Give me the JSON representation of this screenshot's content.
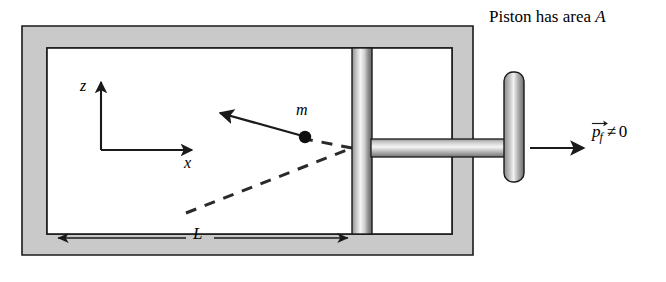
{
  "figure": {
    "title_caption": "Piston has area A",
    "caption_prefix": "Piston has area ",
    "caption_var": "A",
    "labels": {
      "axis_z": "z",
      "axis_x": "x",
      "mass": "m",
      "length": "L",
      "momentum_p": "p",
      "momentum_sub": "f",
      "momentum_rel": "≠",
      "momentum_value": "0"
    },
    "colors": {
      "wall_fill": "#c9c9c9",
      "wall_stroke": "#1a1a1a",
      "cavity_fill": "#ffffff",
      "ink": "#1a1a1a",
      "piston_light": "#f2f2f2",
      "piston_dark": "#6e6e6e",
      "rod_light": "#ededed",
      "rod_dark": "#7a7a7a"
    },
    "geometry": {
      "outer_box": {
        "x": 22,
        "y": 26,
        "w": 451,
        "h": 229
      },
      "cavity": {
        "x": 47,
        "y": 48,
        "w": 405,
        "h": 186
      },
      "wall_thickness": 22,
      "piston_bar": {
        "x": 352,
        "y": 48,
        "w": 20,
        "h": 186
      },
      "rod": {
        "x": 372,
        "y": 139,
        "w": 134,
        "h": 18
      },
      "handle_plate": {
        "x": 504,
        "y": 72,
        "w": 20,
        "h": 110
      },
      "axis_origin": {
        "x": 101,
        "y": 150
      },
      "axis_z_tip": {
        "x": 101,
        "y": 78
      },
      "axis_x_tip": {
        "x": 196,
        "y": 150
      },
      "particle": {
        "x": 305,
        "y": 137,
        "r": 6
      },
      "momentum_arrow_tip": {
        "x": 216,
        "y": 112
      },
      "dashed_in_start": {
        "x": 186,
        "y": 213
      },
      "dashed_collision": {
        "x": 352,
        "y": 148
      },
      "dimension_line": {
        "x1": 54,
        "x2": 351,
        "y": 238
      },
      "piston_arrow": {
        "x1": 530,
        "x2": 580,
        "y": 148
      }
    }
  }
}
